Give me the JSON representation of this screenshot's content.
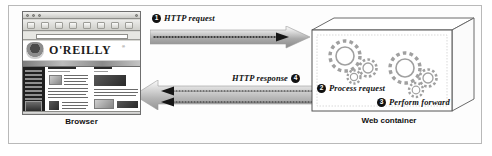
{
  "figure": {
    "accent_color": "#111111",
    "arrow_color": "#8d8d8d",
    "frame_color": "#b9b9b9"
  },
  "browser": {
    "caption": "Browser",
    "site_wordmark": "O'REILLY",
    "site_trademark": "®",
    "address_value": "",
    "address_placeholder": ""
  },
  "web_container": {
    "caption": "Web container"
  },
  "callouts": [
    {
      "number": "1",
      "text": "HTTP request",
      "position": "above-top-arrow"
    },
    {
      "number": "2",
      "text": "Process request",
      "position": "inside-container-left"
    },
    {
      "number": "3",
      "text": "Perform forward",
      "position": "inside-container-right"
    },
    {
      "number": "4",
      "text": "HTTP response",
      "position": "above-bottom-arrow"
    }
  ],
  "arrows": [
    {
      "name": "http-request-arrow",
      "direction": "right",
      "style": "dotted-inside-block-arrow"
    },
    {
      "name": "http-response-arrow",
      "direction": "left",
      "style": "dotted-inside-block-arrow"
    }
  ]
}
